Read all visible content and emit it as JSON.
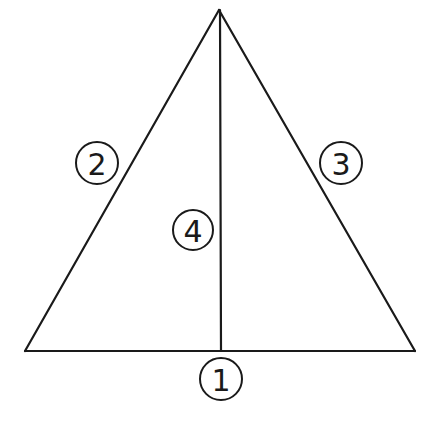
{
  "diagram": {
    "type": "triangle-with-median",
    "colors": {
      "stroke": "#1a1a1a",
      "background": "#ffffff"
    },
    "vertices": {
      "apex": [
        219,
        10
      ],
      "base_left": [
        25,
        351
      ],
      "base_right": [
        415,
        351
      ],
      "median_foot": [
        221,
        351
      ]
    },
    "labels": [
      {
        "id": "1",
        "text": "1",
        "target": "base",
        "cx": 221,
        "cy": 379,
        "r": 21
      },
      {
        "id": "2",
        "text": "2",
        "target": "left-side",
        "cx": 97,
        "cy": 163,
        "r": 21
      },
      {
        "id": "3",
        "text": "3",
        "target": "right-side",
        "cx": 341,
        "cy": 163,
        "r": 21
      },
      {
        "id": "4",
        "text": "4",
        "target": "median",
        "cx": 193,
        "cy": 230,
        "r": 20
      }
    ]
  }
}
